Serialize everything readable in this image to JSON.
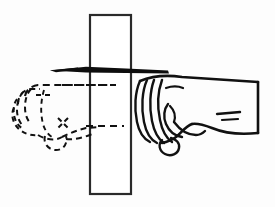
{
  "figure": {
    "kind": "line-art-instructional-illustration",
    "width": 275,
    "height": 207,
    "background_color": "#fdfdfd",
    "ink_color": "#111111",
    "board_stroke_color": "#2a2a2a",
    "arrow_color": "#0d0d0d"
  },
  "elements": {
    "board": {
      "name": "wooden-board",
      "description": "Tall narrow vertical rectangle standing upright in the center, drawn in solid outline with white fill",
      "left": 90,
      "top": 15,
      "right": 131,
      "bottom": 194
    },
    "arrow": {
      "name": "motion-arrow",
      "description": "Long thin tapered wedge arrow pointing left, crossing over the board",
      "direction": "left",
      "tip_x": 50,
      "tail_x": 170,
      "y": 71
    },
    "target_fist": {
      "name": "target-fist-phantom",
      "line_style": "dashed",
      "description": "Left-hand fist drawn in dashed phantom outline showing the follow-through target position beyond the board"
    },
    "striking_fist": {
      "name": "striking-fist",
      "line_style": "solid",
      "description": "Right-hand closed fist with forearm, drawn in solid outline, approaching the board from the right"
    },
    "trajectory_lines": {
      "name": "trajectory-dashed-guides",
      "count": 2,
      "description": "Two horizontal dashed guide lines running through the board linking the solid fist to the phantom fist"
    },
    "forearm": {
      "name": "forearm",
      "description": "Forearm extending to the right edge of the frame, cut off by the frame border, with two short tendon marks"
    }
  }
}
